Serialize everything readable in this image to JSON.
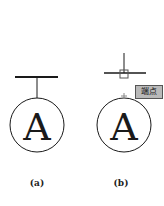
{
  "figures": [
    {
      "id": "a",
      "caption": "(a)",
      "symbol_letter": "A"
    },
    {
      "id": "b",
      "caption": "(b)",
      "symbol_letter": "A",
      "snap_tooltip": "端点"
    }
  ],
  "colors": {
    "line": "#1a1a1a",
    "tooltip_bg": "#b9b9b9",
    "snap_marker": "#555555"
  }
}
